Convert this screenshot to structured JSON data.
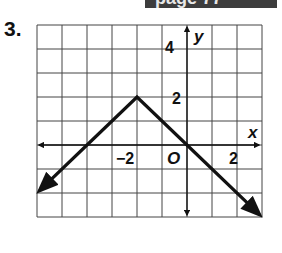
{
  "header": {
    "text": "page 77"
  },
  "problem": {
    "number": "3."
  },
  "chart_data": {
    "type": "line",
    "title": "",
    "xlabel": "x",
    "ylabel": "y",
    "xlim": [
      -6,
      3
    ],
    "ylim": [
      -3,
      5
    ],
    "grid": true,
    "origin_label": "O",
    "x_tick_labels": [
      {
        "value": -2,
        "label": "−2"
      },
      {
        "value": 2,
        "label": "2"
      }
    ],
    "y_tick_labels": [
      {
        "value": 2,
        "label": "2"
      },
      {
        "value": 4,
        "label": "4"
      }
    ],
    "series": [
      {
        "name": "y = -|x + 2| + 2",
        "x": [
          -5.9,
          -4,
          -2,
          0,
          2.9
        ],
        "y": [
          -1.9,
          0,
          2,
          0,
          -2.9
        ],
        "arrows": "both"
      }
    ],
    "legend": "none"
  },
  "colors": {
    "line": "#111111",
    "grid": "#444444",
    "header": "#3d3d3d"
  }
}
